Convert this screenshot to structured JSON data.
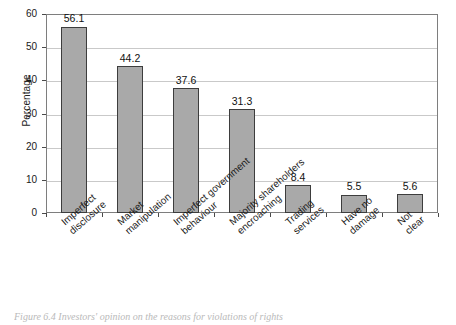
{
  "figure": {
    "caption": "Figure 6.4 Investors' opinion on the reasons for violations of rights"
  },
  "chart_data": {
    "type": "bar",
    "title": "",
    "xlabel": "",
    "ylabel": "Percentage",
    "ylim": [
      0,
      60
    ],
    "ytick_step": 10,
    "yticks": [
      "0",
      "10",
      "20",
      "30",
      "40",
      "50",
      "60"
    ],
    "grid": true,
    "legend": "none",
    "orientation": "vertical",
    "bar_color": "#a9a9a9",
    "bar_border_color": "#3d3d3d",
    "value_labels": true,
    "categories": [
      "Imperfect disclosure",
      "Market manipulation",
      "Imperfect government behaviour",
      "Majority shareholders encroaching",
      "Trading services",
      "Have no damage",
      "Not clear"
    ],
    "category_lines": [
      [
        "Imperfect",
        "disclosure"
      ],
      [
        "Market",
        "manipulation"
      ],
      [
        "Imperfect government",
        "behaviour"
      ],
      [
        "Majority shareholders",
        "encroaching"
      ],
      [
        "Trading",
        "services"
      ],
      [
        "Have no",
        "damage"
      ],
      [
        "Not",
        "clear"
      ]
    ],
    "values": [
      56.1,
      44.2,
      37.6,
      31.3,
      8.4,
      5.5,
      5.6
    ],
    "value_label_text": [
      "56.1",
      "44.2",
      "37.6",
      "31.3",
      "8.4",
      "5.5",
      "5.6"
    ]
  }
}
